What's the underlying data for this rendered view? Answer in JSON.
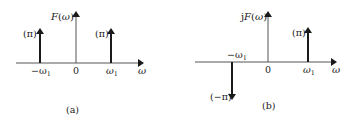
{
  "panels": [
    {
      "id": "a",
      "caption": "(a)",
      "ylabel": "F(ω)",
      "xlabel": "ω",
      "ticks": {
        "neg": "−ω",
        "neg_sub": "1",
        "zero": "0",
        "pos": "ω",
        "pos_sub": "1"
      },
      "impulses": [
        {
          "at": "-ω1",
          "weight_label": "(π)",
          "direction": "up"
        },
        {
          "at": "ω1",
          "weight_label": "(π)",
          "direction": "up"
        }
      ]
    },
    {
      "id": "b",
      "caption": "(b)",
      "ylabel": "jF(ω)",
      "xlabel": "ω",
      "ticks": {
        "neg": "−ω",
        "neg_sub": "1",
        "zero": "0",
        "pos": "ω",
        "pos_sub": "1"
      },
      "impulses": [
        {
          "at": "-ω1",
          "weight_label": "(−π)",
          "direction": "down"
        },
        {
          "at": "ω1",
          "weight_label": "(π)",
          "direction": "up"
        }
      ]
    }
  ],
  "colors": {
    "stroke": "#1a1a1a",
    "axis": "#555555"
  }
}
